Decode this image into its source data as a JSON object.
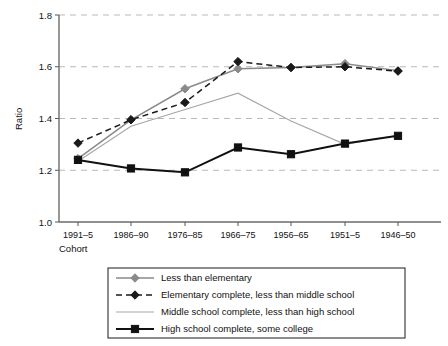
{
  "chart_data": {
    "type": "line",
    "title": "",
    "xlabel": "Cohort",
    "ylabel": "Ratio",
    "categories": [
      "1991–5",
      "1986–90",
      "1976–85",
      "1966–75",
      "1956–65",
      "1951–5",
      "1946–50"
    ],
    "ylim": [
      1.0,
      1.8
    ],
    "yticks": [
      "1.0",
      "1.2",
      "1.4",
      "1.6",
      "1.8"
    ],
    "ytick_values": [
      1.0,
      1.2,
      1.4,
      1.6,
      1.8
    ],
    "grid": "horizontal-dashed",
    "legend_position": "below-plot",
    "series": [
      {
        "name": "Less than elementary",
        "values": [
          1.245,
          1.395,
          1.515,
          1.592,
          1.597,
          1.612,
          1.585
        ],
        "color": "#8a8a8a",
        "marker": "diamond",
        "dash": "solid"
      },
      {
        "name": "Elementary complete, less than middle school",
        "values": [
          1.305,
          1.395,
          1.462,
          1.62,
          1.597,
          1.6,
          1.583
        ],
        "color": "#1a1a1a",
        "marker": "diamond",
        "dash": "dashed"
      },
      {
        "name": "Middle school complete, less than high school",
        "values": [
          1.235,
          1.37,
          1.435,
          1.498,
          1.39,
          1.3,
          1.335
        ],
        "color": "#a6a6a6",
        "marker": "none",
        "dash": "solid"
      },
      {
        "name": "High school complete, some college",
        "values": [
          1.24,
          1.207,
          1.192,
          1.288,
          1.262,
          1.303,
          1.333
        ],
        "color": "#111111",
        "marker": "square",
        "dash": "solid"
      }
    ]
  },
  "axis": {
    "y_title": "Ratio",
    "x_title": "Cohort"
  }
}
